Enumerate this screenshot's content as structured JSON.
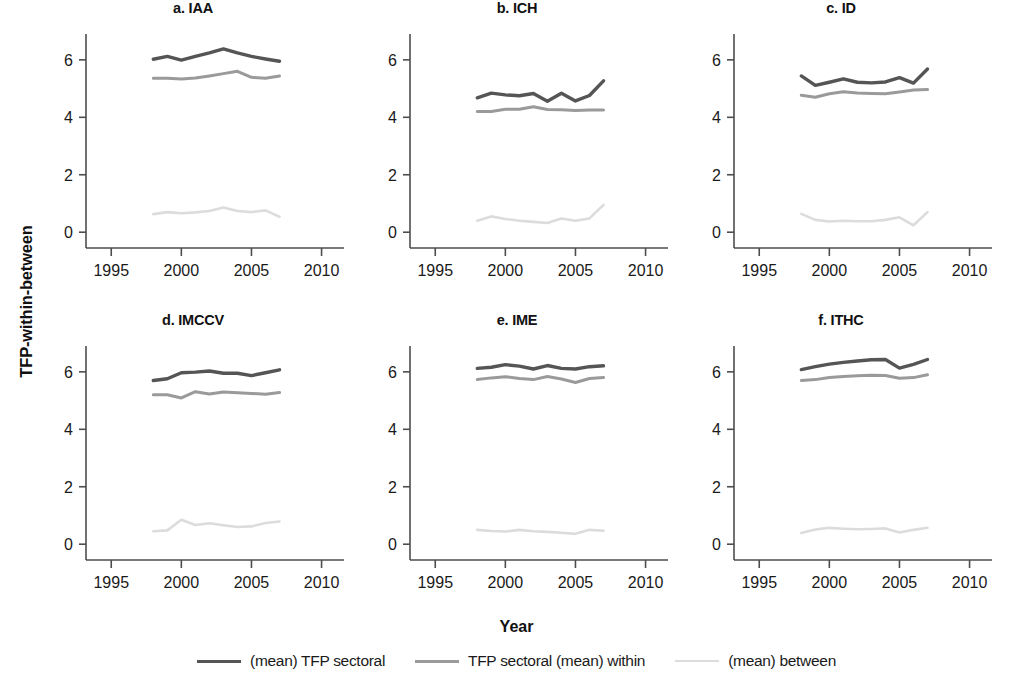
{
  "figure": {
    "ylabel": "TFP-within-between",
    "xlabel": "Year"
  },
  "legend": {
    "items": [
      {
        "label": "(mean) TFP sectoral",
        "color": "#555555",
        "width": 3.4
      },
      {
        "label": "TFP sectoral (mean) within",
        "color": "#9a9a9a",
        "width": 3.0
      },
      {
        "label": "(mean) between",
        "color": "#dcdcdc",
        "width": 2.6
      }
    ]
  },
  "axes": {
    "x_ticks": [
      "1995",
      "2000",
      "2005",
      "2010"
    ],
    "x_tick_values": [
      1995,
      2000,
      2005,
      2010
    ],
    "y_ticks": [
      "0",
      "2",
      "4",
      "6"
    ],
    "y_tick_values": [
      0,
      2,
      4,
      6
    ],
    "xlim": [
      1993.2,
      2011.6
    ],
    "ylim": [
      -0.55,
      6.9
    ]
  },
  "chart_data": [
    {
      "type": "line",
      "title": "a. IAA",
      "panel": "a",
      "xlabel": "Year",
      "ylabel": "TFP-within-between",
      "x": [
        1998,
        1999,
        2000,
        2001,
        2002,
        2003,
        2004,
        2005,
        2006,
        2007
      ],
      "xlim": [
        1993.2,
        2011.6
      ],
      "ylim": [
        -0.55,
        6.9
      ],
      "grid": false,
      "legend_position": "bottom",
      "series": [
        {
          "name": "(mean) TFP sectoral",
          "color": "#555555",
          "values": [
            6.02,
            6.12,
            5.99,
            6.12,
            6.24,
            6.38,
            6.24,
            6.12,
            6.03,
            5.95
          ]
        },
        {
          "name": "TFP sectoral (mean) within",
          "color": "#9a9a9a",
          "values": [
            5.36,
            5.36,
            5.33,
            5.37,
            5.44,
            5.52,
            5.6,
            5.39,
            5.36,
            5.44
          ]
        },
        {
          "name": "(mean) between",
          "color": "#dcdcdc",
          "values": [
            0.63,
            0.7,
            0.66,
            0.69,
            0.74,
            0.86,
            0.74,
            0.7,
            0.76,
            0.54
          ]
        }
      ]
    },
    {
      "type": "line",
      "title": "b. ICH",
      "panel": "b",
      "xlabel": "Year",
      "ylabel": "TFP-within-between",
      "x": [
        1998,
        1999,
        2000,
        2001,
        2002,
        2003,
        2004,
        2005,
        2006,
        2007
      ],
      "xlim": [
        1993.2,
        2011.6
      ],
      "ylim": [
        -0.55,
        6.9
      ],
      "grid": false,
      "legend_position": "bottom",
      "series": [
        {
          "name": "(mean) TFP sectoral",
          "color": "#555555",
          "values": [
            4.68,
            4.84,
            4.78,
            4.75,
            4.83,
            4.56,
            4.84,
            4.57,
            4.76,
            5.27
          ]
        },
        {
          "name": "TFP sectoral (mean) within",
          "color": "#9a9a9a",
          "values": [
            4.2,
            4.2,
            4.28,
            4.28,
            4.37,
            4.27,
            4.26,
            4.24,
            4.25,
            4.25
          ]
        },
        {
          "name": "(mean) between",
          "color": "#dcdcdc",
          "values": [
            0.4,
            0.55,
            0.46,
            0.4,
            0.36,
            0.32,
            0.48,
            0.4,
            0.48,
            0.95
          ]
        }
      ]
    },
    {
      "type": "line",
      "title": "c. ID",
      "panel": "c",
      "xlabel": "Year",
      "ylabel": "TFP-within-between",
      "x": [
        1998,
        1999,
        2000,
        2001,
        2002,
        2003,
        2004,
        2005,
        2006,
        2007
      ],
      "xlim": [
        1993.2,
        2011.6
      ],
      "ylim": [
        -0.55,
        6.9
      ],
      "grid": false,
      "legend_position": "bottom",
      "series": [
        {
          "name": "(mean) TFP sectoral",
          "color": "#555555",
          "values": [
            5.44,
            5.11,
            5.22,
            5.34,
            5.22,
            5.2,
            5.23,
            5.38,
            5.19,
            5.68
          ]
        },
        {
          "name": "TFP sectoral (mean) within",
          "color": "#9a9a9a",
          "values": [
            4.77,
            4.7,
            4.82,
            4.89,
            4.85,
            4.83,
            4.82,
            4.88,
            4.95,
            4.97
          ]
        },
        {
          "name": "(mean) between",
          "color": "#dcdcdc",
          "values": [
            0.64,
            0.43,
            0.37,
            0.4,
            0.38,
            0.38,
            0.43,
            0.52,
            0.24,
            0.7
          ]
        }
      ]
    },
    {
      "type": "line",
      "title": "d. IMCCV",
      "panel": "d",
      "xlabel": "Year",
      "ylabel": "TFP-within-between",
      "x": [
        1998,
        1999,
        2000,
        2001,
        2002,
        2003,
        2004,
        2005,
        2006,
        2007
      ],
      "xlim": [
        1993.2,
        2011.6
      ],
      "ylim": [
        -0.55,
        6.9
      ],
      "grid": false,
      "legend_position": "bottom",
      "series": [
        {
          "name": "(mean) TFP sectoral",
          "color": "#555555",
          "values": [
            5.7,
            5.76,
            5.97,
            5.99,
            6.03,
            5.95,
            5.95,
            5.87,
            5.97,
            6.07
          ]
        },
        {
          "name": "TFP sectoral (mean) within",
          "color": "#9a9a9a",
          "values": [
            5.2,
            5.2,
            5.09,
            5.31,
            5.23,
            5.3,
            5.27,
            5.25,
            5.22,
            5.28
          ]
        },
        {
          "name": "(mean) between",
          "color": "#dcdcdc",
          "values": [
            0.45,
            0.48,
            0.85,
            0.67,
            0.73,
            0.66,
            0.6,
            0.62,
            0.74,
            0.79
          ]
        }
      ]
    },
    {
      "type": "line",
      "title": "e. IME",
      "panel": "e",
      "xlabel": "Year",
      "ylabel": "TFP-within-between",
      "x": [
        1998,
        1999,
        2000,
        2001,
        2002,
        2003,
        2004,
        2005,
        2006,
        2007
      ],
      "xlim": [
        1993.2,
        2011.6
      ],
      "ylim": [
        -0.55,
        6.9
      ],
      "grid": false,
      "legend_position": "bottom",
      "series": [
        {
          "name": "(mean) TFP sectoral",
          "color": "#555555",
          "values": [
            6.12,
            6.16,
            6.25,
            6.2,
            6.1,
            6.22,
            6.12,
            6.1,
            6.18,
            6.21
          ]
        },
        {
          "name": "TFP sectoral (mean) within",
          "color": "#9a9a9a",
          "values": [
            5.73,
            5.79,
            5.83,
            5.77,
            5.73,
            5.84,
            5.75,
            5.63,
            5.77,
            5.8
          ]
        },
        {
          "name": "(mean) between",
          "color": "#dcdcdc",
          "values": [
            0.5,
            0.46,
            0.44,
            0.5,
            0.45,
            0.43,
            0.4,
            0.36,
            0.5,
            0.47
          ]
        }
      ]
    },
    {
      "type": "line",
      "title": "f. ITHC",
      "panel": "f",
      "xlabel": "Year",
      "ylabel": "TFP-within-between",
      "x": [
        1998,
        1999,
        2000,
        2001,
        2002,
        2003,
        2004,
        2005,
        2006,
        2007
      ],
      "xlim": [
        1993.2,
        2011.6
      ],
      "ylim": [
        -0.55,
        6.9
      ],
      "grid": false,
      "legend_position": "bottom",
      "series": [
        {
          "name": "(mean) TFP sectoral",
          "color": "#555555",
          "values": [
            6.08,
            6.18,
            6.27,
            6.33,
            6.38,
            6.42,
            6.43,
            6.13,
            6.26,
            6.43
          ]
        },
        {
          "name": "TFP sectoral (mean) within",
          "color": "#9a9a9a",
          "values": [
            5.7,
            5.73,
            5.8,
            5.84,
            5.86,
            5.88,
            5.87,
            5.78,
            5.8,
            5.9
          ]
        },
        {
          "name": "(mean) between",
          "color": "#dcdcdc",
          "values": [
            0.39,
            0.51,
            0.57,
            0.54,
            0.52,
            0.53,
            0.55,
            0.41,
            0.5,
            0.57
          ]
        }
      ]
    }
  ]
}
